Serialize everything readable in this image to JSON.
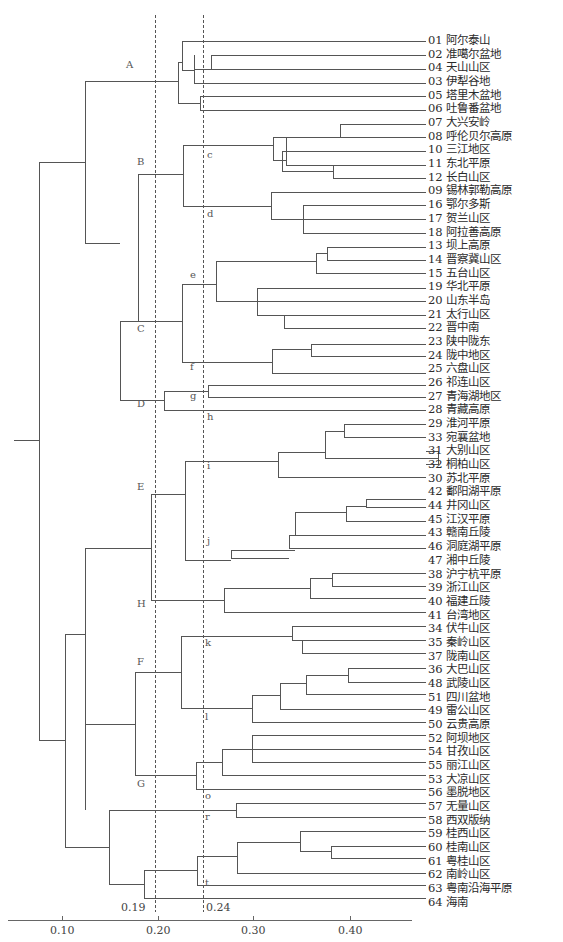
{
  "chart_data": {
    "type": "dendrogram",
    "title": "",
    "xlabel": "",
    "x_ticks": [
      "0.10",
      "0.20",
      "0.30",
      "0.40"
    ],
    "x_tick_values": [
      0.1,
      0.2,
      0.3,
      0.4
    ],
    "cut_lines": [
      {
        "label": "0.19",
        "value": 0.19
      },
      {
        "label": "0.24",
        "value": 0.24
      }
    ],
    "leaves": [
      "01 阿尔泰山",
      "02 准噶尔盆地",
      "04 天山山区",
      "03 伊犁谷地",
      "05 塔里木盆地",
      "06 吐鲁番盆地",
      "07 大兴安岭",
      "08 呼伦贝尔高原",
      "10 三江地区",
      "11 东北平原",
      "12 长白山区",
      "09 锡林郭勒高原",
      "16 鄂尔多斯",
      "17 贺兰山区",
      "18 阿拉善高原",
      "13 坝上高原",
      "14 晋察冀山区",
      "15 五台山区",
      "19 华北平原",
      "20 山东半岛",
      "21 太行山区",
      "22 晋中南",
      "23 陕中陇东",
      "24 陇中地区",
      "25 六盘山区",
      "26 祁连山区",
      "27 青海湖地区",
      "28 青藏高原",
      "29 淮河平原",
      "33 宛襄盆地",
      "31 大别山区",
      "32 桐柏山区",
      "30 苏北平原",
      "42 鄱阳湖平原",
      "44 井冈山区",
      "45 江汉平原",
      "43 赣南丘陵",
      "46 洞庭湖平原",
      "47 湘中丘陵",
      "38 沪宁杭平原",
      "39 浙江山区",
      "40 福建丘陵",
      "41 台湾地区",
      "34 伏牛山区",
      "35 秦岭山区",
      "37 陇南山区",
      "36 大巴山区",
      "48 武陵山区",
      "51 四川盆地",
      "49 雷公山区",
      "50 云贵高原",
      "52 阿坝地区",
      "54 甘孜山区",
      "55 丽江山区",
      "53 大凉山区",
      "56 墨脱地区",
      "57 无量山区",
      "58 西双版纳",
      "59 桂西山区",
      "60 桂南山区",
      "61 粤桂山区",
      "62 南岭山区",
      "63 粤南沿海平原",
      "64 海南"
    ],
    "cluster_labels": [
      {
        "label": "A",
        "x": 126,
        "y": 66
      },
      {
        "label": "B",
        "x": 137,
        "y": 163
      },
      {
        "label": "C",
        "x": 137,
        "y": 330
      },
      {
        "label": "D",
        "x": 137,
        "y": 405
      },
      {
        "label": "E",
        "x": 137,
        "y": 488
      },
      {
        "label": "H",
        "x": 137,
        "y": 605
      },
      {
        "label": "F",
        "x": 137,
        "y": 663
      },
      {
        "label": "G",
        "x": 137,
        "y": 785
      },
      {
        "label": "c",
        "x": 207,
        "y": 156
      },
      {
        "label": "d",
        "x": 207,
        "y": 215
      },
      {
        "label": "e",
        "x": 190,
        "y": 276
      },
      {
        "label": "f",
        "x": 190,
        "y": 368
      },
      {
        "label": "g",
        "x": 190,
        "y": 397
      },
      {
        "label": "h",
        "x": 207,
        "y": 418
      },
      {
        "label": "i",
        "x": 207,
        "y": 467
      },
      {
        "label": "j",
        "x": 207,
        "y": 542
      },
      {
        "label": "k",
        "x": 205,
        "y": 644
      },
      {
        "label": "l",
        "x": 205,
        "y": 718
      },
      {
        "label": "o",
        "x": 205,
        "y": 797
      },
      {
        "label": "r",
        "x": 205,
        "y": 818
      },
      {
        "label": "t",
        "x": 205,
        "y": 884
      }
    ],
    "links": [
      [
        182,
        41,
        182,
        70
      ],
      [
        194,
        55,
        194,
        83
      ],
      [
        211,
        55,
        211,
        69
      ],
      [
        178,
        62,
        178,
        103
      ],
      [
        200,
        96,
        200,
        110
      ],
      [
        340,
        124,
        340,
        137
      ],
      [
        282,
        151,
        282,
        171
      ],
      [
        333,
        165,
        333,
        178
      ],
      [
        286,
        137,
        286,
        160
      ],
      [
        183,
        145,
        183,
        206
      ],
      [
        271,
        192,
        271,
        219
      ],
      [
        303,
        205,
        303,
        233
      ],
      [
        138,
        174,
        138,
        321
      ],
      [
        215,
        261,
        215,
        291
      ],
      [
        327,
        247,
        327,
        260
      ],
      [
        316,
        247,
        316,
        273
      ],
      [
        257,
        288,
        257,
        315
      ],
      [
        284,
        315,
        284,
        328
      ],
      [
        217,
        261,
        217,
        301
      ],
      [
        182,
        284,
        182,
        362
      ],
      [
        272,
        349,
        272,
        373
      ],
      [
        311,
        344,
        311,
        356
      ],
      [
        119,
        200,
        119,
        409
      ],
      [
        85,
        60,
        85,
        243
      ],
      [
        164,
        384,
        164,
        410
      ],
      [
        208,
        385,
        208,
        397
      ],
      [
        39,
        200,
        39,
        634
      ],
      [
        344,
        424,
        344,
        437
      ],
      [
        325,
        431,
        325,
        458
      ],
      [
        278,
        452,
        278,
        477
      ],
      [
        438,
        451,
        438,
        464
      ],
      [
        366,
        499,
        366,
        507
      ],
      [
        346,
        506,
        346,
        521
      ],
      [
        295,
        512,
        295,
        542
      ],
      [
        289,
        533,
        289,
        548
      ],
      [
        231,
        550,
        231,
        558
      ],
      [
        185,
        461,
        185,
        560
      ],
      [
        151,
        494,
        151,
        600
      ],
      [
        332,
        573,
        332,
        586
      ],
      [
        310,
        578,
        310,
        598
      ],
      [
        224,
        588,
        224,
        612
      ],
      [
        85,
        248,
        85,
        810
      ],
      [
        292,
        626,
        292,
        640
      ],
      [
        302,
        640,
        302,
        653
      ],
      [
        181,
        636,
        181,
        708
      ],
      [
        348,
        668,
        348,
        682
      ],
      [
        306,
        675,
        306,
        694
      ],
      [
        280,
        688,
        280,
        709
      ],
      [
        252,
        695,
        252,
        722
      ],
      [
        135,
        672,
        135,
        775
      ],
      [
        252,
        735,
        252,
        762
      ],
      [
        222,
        749,
        222,
        775
      ],
      [
        196,
        762,
        196,
        789
      ],
      [
        65,
        634,
        65,
        845
      ],
      [
        236,
        803,
        236,
        817
      ],
      [
        300,
        831,
        300,
        851
      ],
      [
        331,
        846,
        331,
        858
      ],
      [
        237,
        842,
        237,
        873
      ],
      [
        197,
        856,
        197,
        885
      ],
      [
        144,
        870,
        144,
        898
      ],
      [
        109,
        810,
        109,
        884
      ]
    ]
  }
}
